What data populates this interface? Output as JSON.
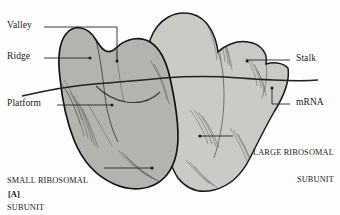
{
  "figure": {
    "panel_tag": "[A]",
    "background_color": "#fdfdfb",
    "subunit_fill_light": "#c8c8c3",
    "subunit_fill_dark": "#a9a9a4",
    "outline_color": "#1a1a1a",
    "leader_color": "#26262b",
    "text_color": "#1c1c1c"
  },
  "labels": {
    "valley": "Valley",
    "ridge": "Ridge",
    "platform": "Platform",
    "small_subunit_line1": "SMALL RIBOSOMAL",
    "small_subunit_line2": "SUBUNIT",
    "stalk": "Stalk",
    "mrna": "mRNA",
    "large_subunit_line1": "LARGE RIBOSOMAL",
    "large_subunit_line2": "SUBUNIT"
  }
}
